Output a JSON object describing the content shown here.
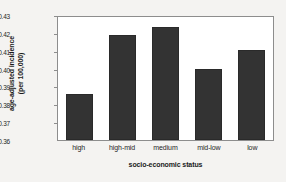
{
  "chart_data": {
    "type": "bar",
    "title": "",
    "categories": [
      "high",
      "high-mid",
      "medium",
      "mid-low",
      "low"
    ],
    "values": [
      0.386,
      0.4195,
      0.4245,
      0.4005,
      0.411
    ],
    "xlabel": "socio-economic status",
    "ylabel_line1": "age-adjusted incidence",
    "ylabel_line2": "(per 100,000)",
    "ylim": [
      0.36,
      0.43
    ],
    "ytick_labels": [
      "0.43",
      "0.42",
      "0.41",
      "0.40",
      "0.39",
      "0.38",
      "0.37",
      "0.36"
    ],
    "ytick_values": [
      0.43,
      0.42,
      0.41,
      0.4,
      0.39,
      0.38,
      0.37,
      0.36
    ],
    "grid": false,
    "legend": "none",
    "bar_color": "#333333",
    "plot_background": "#ffffff",
    "page_background": "#f4f3f1",
    "frame_color": "#8d8d8d"
  }
}
